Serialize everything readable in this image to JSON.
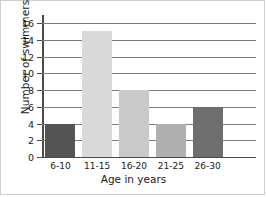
{
  "chart_data": {
    "type": "bar",
    "title": "",
    "subtitle": "",
    "categories": [
      "6-10",
      "11-15",
      "16-20",
      "21-25",
      "26-30"
    ],
    "values": [
      4,
      15,
      8,
      4,
      6
    ],
    "xlabel": "Age in years",
    "ylabel": "Number of swimmers",
    "ylim": [
      0,
      16
    ],
    "ytick_step": 2,
    "yticks": [
      0,
      2,
      4,
      6,
      8,
      10,
      12,
      14,
      16
    ],
    "ytick_labels": [
      "0",
      "2",
      "4",
      "6",
      "8",
      "10",
      "12",
      "14",
      "16"
    ],
    "grid": true,
    "grid_axis": "y",
    "legend": false,
    "legend_position": "none",
    "bar_colors": [
      "#555555",
      "#d9d9d9",
      "#c9c9c9",
      "#b0b0b0",
      "#6e6e6e"
    ],
    "grid_color": "#7d7d7d",
    "axis_color": "#4a4a4a",
    "text_color": "#1a1a1a",
    "background": "#ffffff"
  }
}
